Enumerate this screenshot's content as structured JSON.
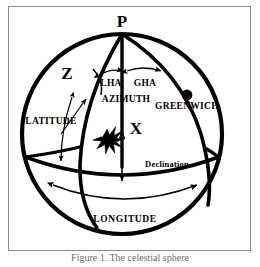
{
  "figure": {
    "caption": "Figure 1. The celestial sphere",
    "border_color": "#8c8c8c",
    "ink_color": "#000000",
    "background_color": "#ffffff"
  },
  "diagram": {
    "type": "celestial-sphere",
    "labels": {
      "pole": "P",
      "zenith": "Z",
      "star": "X",
      "local_hour_angle": "LHA",
      "greenwich_hour_angle": "GHA",
      "azimuth": "AZIMUTH",
      "greenwich": "GREENWICH",
      "latitude": "LATITUDE",
      "longitude": "LONGITUDE",
      "declination": "Declination"
    },
    "markers": {
      "greenwich_dot": "filled-circle",
      "star_marker": "eight-point-star"
    },
    "arrows": {
      "lha": "double-headed-arc",
      "gha": "double-headed-arc",
      "azimuth": "single-arc",
      "latitude": "double-headed-arrow",
      "longitude": "double-headed-arc",
      "declination": "double-headed-arrow"
    }
  }
}
